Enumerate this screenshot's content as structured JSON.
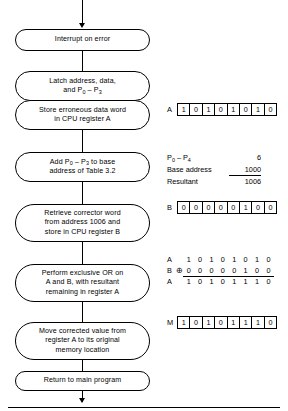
{
  "diagram": {
    "entry_arrow": "down-arrow",
    "exit_arrow": "down-arrow",
    "nodes": [
      {
        "id": "interrupt",
        "text": "Interrupt on error"
      },
      {
        "id": "latch",
        "text": "Latch address, data,\nand P0 – P3"
      },
      {
        "id": "store",
        "text": "Store erroneous data word\nin CPU register A"
      },
      {
        "id": "add",
        "text": "Add P0 – P3 to base\naddress of Table 3.2"
      },
      {
        "id": "retrieve",
        "text": "Retrieve corrector word\nfrom address 1006 and\nstore in CPU register B"
      },
      {
        "id": "xor",
        "text": "Perform exclusive OR on\nA and B, with resultant\nremaining in register A"
      },
      {
        "id": "move",
        "text": "Move corrected value from\nregister A to its original\nmemory location"
      },
      {
        "id": "return",
        "text": "Return to main program"
      }
    ]
  },
  "annotations": {
    "register_a_initial": {
      "label": "A",
      "bits": [
        "1",
        "0",
        "1",
        "0",
        "1",
        "0",
        "1",
        "0"
      ]
    },
    "address_calc": {
      "rows": [
        {
          "name": "P0 – P4",
          "value": "6"
        },
        {
          "name": "Base address",
          "value": "1000"
        },
        {
          "name": "Resultant",
          "value": "1006"
        }
      ]
    },
    "register_b": {
      "label": "B",
      "bits": [
        "0",
        "0",
        "0",
        "0",
        "0",
        "1",
        "0",
        "0"
      ]
    },
    "xor_operation": {
      "operand_a_label": "A",
      "operand_a_bits": [
        "1",
        "0",
        "1",
        "0",
        "1",
        "0",
        "1",
        "0"
      ],
      "operand_b_label": "B",
      "operator": "⊕",
      "operand_b_bits": [
        "0",
        "0",
        "0",
        "0",
        "0",
        "1",
        "0",
        "0"
      ],
      "result_label": "A",
      "result_bits": [
        "1",
        "0",
        "1",
        "0",
        "1",
        "1",
        "1",
        "0"
      ]
    },
    "memory_word": {
      "label": "M",
      "bits": [
        "1",
        "0",
        "1",
        "0",
        "1",
        "1",
        "1",
        "0"
      ]
    }
  }
}
